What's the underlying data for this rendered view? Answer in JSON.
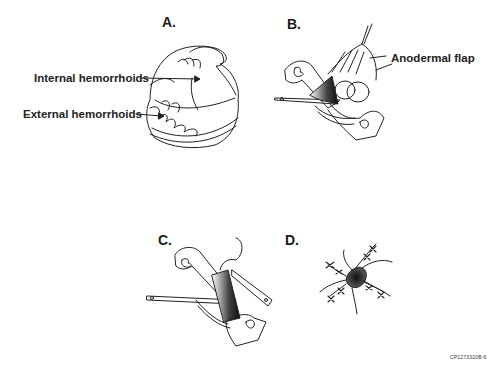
{
  "figure": {
    "panels": [
      {
        "id": "A",
        "label": "A.",
        "description": "Anal canal with internal and external hemorrhoids",
        "annotations": [
          "Internal hemorrhoids",
          "External hemorrhoids"
        ]
      },
      {
        "id": "B",
        "label": "B.",
        "description": "Retractors with anodermal flap elevated",
        "annotations": [
          "Anodermal flap"
        ]
      },
      {
        "id": "C",
        "label": "C.",
        "description": "Excision with retractors in place",
        "annotations": []
      },
      {
        "id": "D",
        "label": "D.",
        "description": "Closed wounds with sutures radiating",
        "annotations": []
      }
    ],
    "code": "CP1273320B-6"
  }
}
